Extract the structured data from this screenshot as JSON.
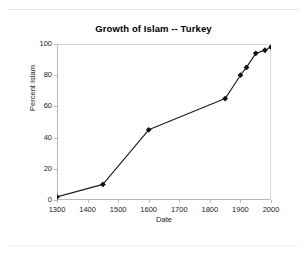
{
  "chart_data": {
    "type": "line",
    "title": "Growth of Islam -- Turkey",
    "xlabel": "Date",
    "ylabel": "Percent Islam",
    "xlim": [
      1300,
      2000
    ],
    "ylim": [
      0,
      100
    ],
    "xticks": [
      1300,
      1400,
      1500,
      1600,
      1700,
      1800,
      1900,
      2000
    ],
    "yticks": [
      0,
      20,
      40,
      60,
      80,
      100
    ],
    "grid": false,
    "legend": null,
    "marker": "diamond",
    "series": [
      {
        "name": "Percent Islam",
        "color": "#000000",
        "points": [
          {
            "x": 1300,
            "y": 2
          },
          {
            "x": 1450,
            "y": 10
          },
          {
            "x": 1600,
            "y": 45
          },
          {
            "x": 1850,
            "y": 65
          },
          {
            "x": 1900,
            "y": 80
          },
          {
            "x": 1920,
            "y": 85
          },
          {
            "x": 1950,
            "y": 94
          },
          {
            "x": 1980,
            "y": 96
          },
          {
            "x": 2000,
            "y": 98
          }
        ]
      }
    ]
  },
  "axis": {
    "ytick_labels": [
      "0",
      "20",
      "40",
      "60",
      "80",
      "100"
    ],
    "xtick_labels": [
      "1300",
      "1400",
      "1500",
      "1600",
      "1700",
      "1800",
      "1900",
      "2000"
    ]
  }
}
